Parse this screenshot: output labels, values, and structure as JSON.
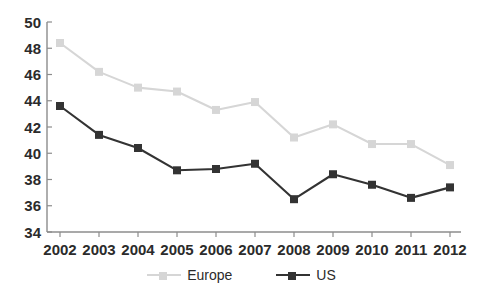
{
  "chart_data": {
    "type": "line",
    "title": "",
    "subtitle": "",
    "xlabel": "",
    "ylabel": "",
    "categories": [
      "2002",
      "2003",
      "2004",
      "2005",
      "2006",
      "2007",
      "2008",
      "2009",
      "2010",
      "2011",
      "2012"
    ],
    "x": [
      2002,
      2003,
      2004,
      2005,
      2006,
      2007,
      2008,
      2009,
      2010,
      2011,
      2012
    ],
    "series": [
      {
        "name": "Europe",
        "color": "#d6d6d6",
        "marker": "square",
        "values": [
          48.4,
          46.2,
          45.0,
          44.7,
          43.3,
          43.9,
          41.2,
          42.2,
          40.7,
          40.7,
          39.1
        ]
      },
      {
        "name": "US",
        "color": "#333333",
        "marker": "square",
        "values": [
          43.6,
          41.4,
          40.4,
          38.7,
          38.8,
          39.2,
          36.5,
          38.4,
          37.6,
          36.6,
          37.4
        ]
      }
    ],
    "ylim": [
      34,
      50
    ],
    "yticks": [
      34,
      36,
      38,
      40,
      42,
      44,
      46,
      48,
      50
    ],
    "ytick_labels": [
      "34",
      "36",
      "38",
      "40",
      "42",
      "44",
      "46",
      "48",
      "50"
    ],
    "xtick_labels": [
      "2002",
      "2003",
      "2004",
      "2005",
      "2006",
      "2007",
      "2008",
      "2009",
      "2010",
      "2011",
      "2012"
    ],
    "grid": false,
    "legend_position": "bottom",
    "axis_color": "#8c8c8c",
    "text_color": "#2b2b2b",
    "background": "#ffffff"
  },
  "legend": {
    "items": [
      {
        "label": "Europe",
        "color": "#d6d6d6"
      },
      {
        "label": "US",
        "color": "#333333"
      }
    ]
  }
}
